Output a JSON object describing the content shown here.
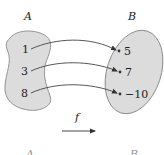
{
  "diagram": {
    "set_a": {
      "label": "A",
      "elements": [
        "1",
        "3",
        "8"
      ]
    },
    "set_b": {
      "label": "B",
      "elements": [
        "5",
        "7",
        "−10"
      ]
    },
    "function": {
      "label": "f"
    },
    "mappings": [
      {
        "from": "1",
        "to": "5"
      },
      {
        "from": "3",
        "to": "7"
      },
      {
        "from": "8",
        "to": "−10"
      }
    ],
    "bottom_labels": {
      "left": "A",
      "right": "B"
    },
    "colors": {
      "set_fill": "#dcdcdc",
      "set_stroke": "#8a8a8a",
      "arrow": "#444444",
      "text": "#222222"
    }
  }
}
